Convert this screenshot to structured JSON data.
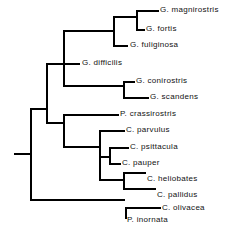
{
  "figure": {
    "type": "cladogram",
    "orientation": "left-to-right",
    "line_color": "#000000",
    "background_color": "#ffffff",
    "text_color": "#111111"
  },
  "taxa": [
    {
      "id": "g_magnirostris",
      "label": "G. magnirostris",
      "x": 160,
      "y": 14
    },
    {
      "id": "g_fortis",
      "label": "G. fortis",
      "x": 146,
      "y": 33
    },
    {
      "id": "g_fuliginosa",
      "label": "G. fuliginosa",
      "x": 130,
      "y": 49
    },
    {
      "id": "g_difficilis",
      "label": "G. difficilis",
      "x": 82,
      "y": 67
    },
    {
      "id": "g_conirostris",
      "label": "G. conirostris",
      "x": 136,
      "y": 85
    },
    {
      "id": "g_scandens",
      "label": "G. scandens",
      "x": 150,
      "y": 101
    },
    {
      "id": "p_crassirostris",
      "label": "P. crassirostris",
      "x": 120,
      "y": 118
    },
    {
      "id": "c_parvulus",
      "label": "C. parvulus",
      "x": 126,
      "y": 134
    },
    {
      "id": "c_psittacula",
      "label": "C. psittacula",
      "x": 130,
      "y": 151
    },
    {
      "id": "c_pauper",
      "label": "C. pauper",
      "x": 122,
      "y": 167
    },
    {
      "id": "c_heliobates",
      "label": "C. heliobates",
      "x": 147,
      "y": 183
    },
    {
      "id": "c_pallidus",
      "label": "C. pallidus",
      "x": 157,
      "y": 199
    },
    {
      "id": "c_olivacea",
      "label": "C. olivacea",
      "x": 162,
      "y": 212
    },
    {
      "id": "p_inornata",
      "label": "P. inornata",
      "x": 127,
      "y": 224
    }
  ],
  "branches": {
    "horizontal": [
      {
        "id": "h-root-stem",
        "x": 14,
        "y": 153,
        "len": 16
      },
      {
        "id": "h-root-upper",
        "x": 30,
        "y": 108,
        "len": 16
      },
      {
        "id": "h-root-lower",
        "x": 30,
        "y": 199,
        "len": 95
      },
      {
        "id": "h-geospiza-stem",
        "x": 46,
        "y": 63,
        "len": 17
      },
      {
        "id": "h-certhid-stem",
        "x": 46,
        "y": 122,
        "len": 17
      },
      {
        "id": "h-geo-upper",
        "x": 63,
        "y": 30,
        "len": 50
      },
      {
        "id": "h-g-difficilis",
        "x": 63,
        "y": 63,
        "len": 17
      },
      {
        "id": "h-geo-lower",
        "x": 63,
        "y": 85,
        "len": 60
      },
      {
        "id": "h-fulig-node",
        "x": 113,
        "y": 16,
        "len": 23
      },
      {
        "id": "h-g-fuliginosa",
        "x": 113,
        "y": 45,
        "len": 15
      },
      {
        "id": "h-g-magnirostris",
        "x": 136,
        "y": 10,
        "len": 23
      },
      {
        "id": "h-g-fortis",
        "x": 136,
        "y": 29,
        "len": 9
      },
      {
        "id": "h-g-conirostris",
        "x": 123,
        "y": 81,
        "len": 12
      },
      {
        "id": "h-g-scandens",
        "x": 123,
        "y": 97,
        "len": 26
      },
      {
        "id": "h-p-crassirostris",
        "x": 63,
        "y": 114,
        "len": 56
      },
      {
        "id": "h-camar-stem",
        "x": 63,
        "y": 146,
        "len": 36
      },
      {
        "id": "h-parv-node",
        "x": 99,
        "y": 130,
        "len": 26
      },
      {
        "id": "h-psitt-pauper-stem",
        "x": 99,
        "y": 156,
        "len": 10
      },
      {
        "id": "h-c-psittacula",
        "x": 109,
        "y": 147,
        "len": 20
      },
      {
        "id": "h-c-pauper",
        "x": 109,
        "y": 163,
        "len": 12
      },
      {
        "id": "h-helio-node",
        "x": 99,
        "y": 179,
        "len": 24
      },
      {
        "id": "h-c-heliobates",
        "x": 123,
        "y": 172,
        "len": 23
      },
      {
        "id": "h-c-pallidus",
        "x": 123,
        "y": 188,
        "len": 33
      },
      {
        "id": "h-c-olivacea",
        "x": 125,
        "y": 207,
        "len": 36
      },
      {
        "id": "h-p-inornata",
        "x": 125,
        "y": 219,
        "len": 0
      }
    ],
    "vertical": [
      {
        "id": "v-root",
        "x": 30,
        "y": 108,
        "len": 91
      },
      {
        "id": "v-node2",
        "x": 46,
        "y": 63,
        "len": 59
      },
      {
        "id": "v-geospiza",
        "x": 63,
        "y": 30,
        "len": 55
      },
      {
        "id": "v-clade-cert",
        "x": 63,
        "y": 114,
        "len": 32
      },
      {
        "id": "v-fulig",
        "x": 113,
        "y": 16,
        "len": 29
      },
      {
        "id": "v-magni-fortis",
        "x": 136,
        "y": 10,
        "len": 19
      },
      {
        "id": "v-coni-scan",
        "x": 123,
        "y": 81,
        "len": 16
      },
      {
        "id": "v-camar-upper",
        "x": 99,
        "y": 130,
        "len": 26
      },
      {
        "id": "v-camar-lower",
        "x": 99,
        "y": 156,
        "len": 23
      },
      {
        "id": "v-psitt-pauper",
        "x": 109,
        "y": 147,
        "len": 16
      },
      {
        "id": "v-helio-pall",
        "x": 123,
        "y": 172,
        "len": 16
      },
      {
        "id": "v-oliv-inor",
        "x": 125,
        "y": 207,
        "len": 12
      }
    ]
  }
}
